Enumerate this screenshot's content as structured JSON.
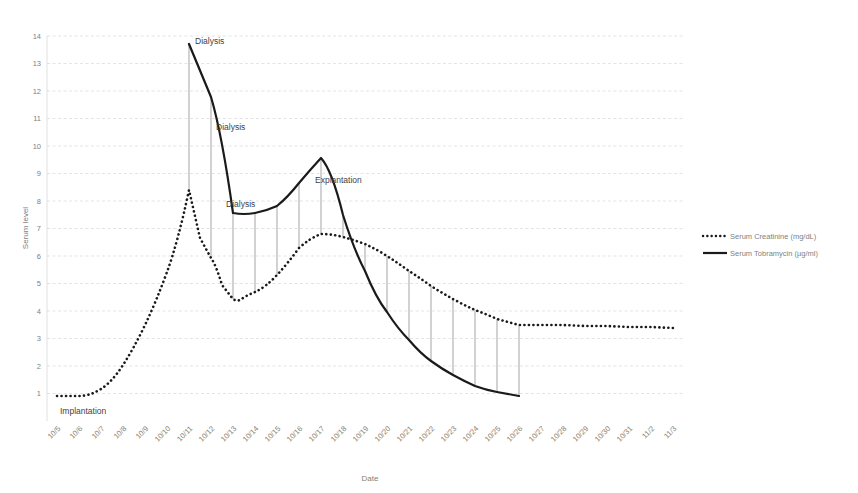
{
  "chart_data": {
    "type": "line",
    "title": "",
    "xlabel": "Date",
    "ylabel": "Serum level",
    "ylim": [
      0,
      14
    ],
    "yticks": [
      1,
      2,
      3,
      4,
      5,
      6,
      7,
      8,
      9,
      10,
      11,
      12,
      13,
      14
    ],
    "grid": true,
    "legend_position": "right",
    "categories": [
      "10/5",
      "10/6",
      "10/7",
      "10/8",
      "10/9",
      "10/10",
      "10/11",
      "10/12",
      "10/13",
      "10/14",
      "10/15",
      "10/16",
      "10/17",
      "10/18",
      "10/19",
      "10/20",
      "10/21",
      "10/22",
      "10/23",
      "10/24",
      "10/25",
      "10/26",
      "10/27",
      "10/28",
      "10/29",
      "10/30",
      "10/31",
      "11/2",
      "11/3"
    ],
    "series": [
      {
        "name": "Serum Creatinine (mg/dL)",
        "style": "dotted",
        "units": "mg/dL",
        "x": [
          "10/5",
          "10/6",
          "10/7",
          "10/8",
          "10/9",
          "10/10",
          "10/11",
          "10/12",
          "10/13",
          "10/14",
          "10/15",
          "10/16",
          "10/17",
          "10/18",
          "10/19",
          "10/20",
          "10/21",
          "10/22",
          "10/23",
          "10/24",
          "10/25",
          "10/26",
          "10/27",
          "10/28",
          "10/29",
          "10/30",
          "10/31",
          "11/2",
          "11/3"
        ],
        "values": [
          1.0,
          1.0,
          1.2,
          1.9,
          3.2,
          5.0,
          8.5,
          6.1,
          4.8,
          5.1,
          5.6,
          6.5,
          6.9,
          6.8,
          6.5,
          6.1,
          5.6,
          5.2,
          4.8,
          4.4,
          4.1,
          3.9,
          3.7,
          3.6,
          3.5,
          3.5,
          3.5,
          3.4,
          3.4
        ]
      },
      {
        "name": "Serum Tobramycin (µg/ml)",
        "style": "solid",
        "units": "µg/ml",
        "x": [
          "10/11",
          "10/12",
          "10/13",
          "10/14",
          "10/15",
          "10/16",
          "10/17",
          "10/18",
          "10/19",
          "10/20",
          "10/21",
          "10/22",
          "10/23",
          "10/24",
          "10/25",
          "10/26"
        ],
        "values": [
          13.7,
          9.7,
          7.0,
          7.0,
          7.2,
          7.9,
          8.7,
          6.8,
          4.3,
          3.0,
          2.2,
          1.6,
          1.2,
          1.0,
          0.9,
          0.85
        ]
      }
    ],
    "annotations": [
      {
        "label": "Implantation",
        "x": "10/5",
        "y": 1.0
      },
      {
        "label": "Dialysis",
        "x": "10/11",
        "y": 13.7
      },
      {
        "label": "Dialysis",
        "x": "10/12",
        "y": 9.7
      },
      {
        "label": "Dialysis",
        "x": "10/13",
        "y": 7.9
      },
      {
        "label": "Explantation",
        "x": "10/17",
        "y": 8.7
      }
    ]
  },
  "legend": {
    "items": [
      {
        "label": "Serum Creatinine (mg/dL)",
        "marker": "dotted-line"
      },
      {
        "label": "Serum Tobramycin (µg/ml)",
        "marker": "solid-line"
      }
    ]
  },
  "axes": {
    "y_title": "Serum level",
    "x_title": "Date",
    "y_tick_labels": [
      "14",
      "13",
      "12",
      "11",
      "10",
      "9",
      "8",
      "7",
      "6",
      "5",
      "4",
      "3",
      "2",
      "1"
    ],
    "x_tick_labels": [
      "10/5",
      "10/6",
      "10/7",
      "10/8",
      "10/9",
      "10/10",
      "10/11",
      "10/12",
      "10/13",
      "10/14",
      "10/15",
      "10/16",
      "10/17",
      "10/18",
      "10/19",
      "10/20",
      "10/21",
      "10/22",
      "10/23",
      "10/24",
      "10/25",
      "10/26",
      "10/27",
      "10/28",
      "10/29",
      "10/30",
      "10/31",
      "11/2",
      "11/3"
    ]
  },
  "colors": {
    "grid": "#d9d9d9",
    "series_line": "#1a1a1a",
    "dropline": "#808080",
    "text": "#7f7f7f"
  }
}
